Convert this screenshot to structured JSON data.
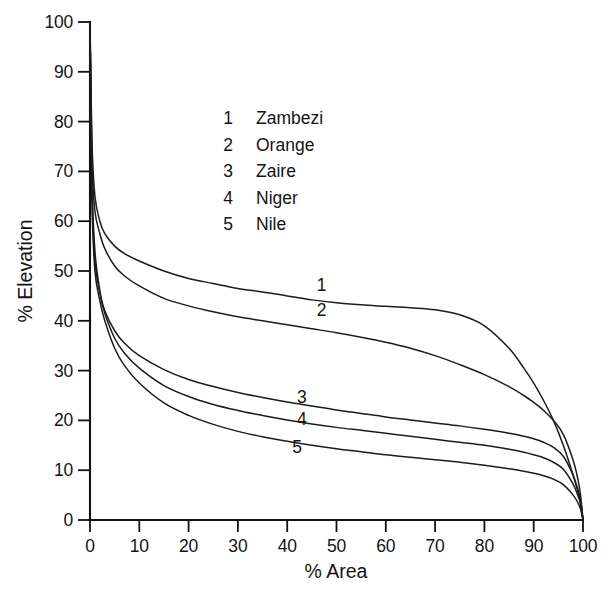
{
  "chart_data": {
    "type": "line",
    "title": "",
    "xlabel": "% Area",
    "ylabel": "% Elevation",
    "xlim": [
      0,
      100
    ],
    "ylim": [
      0,
      100
    ],
    "xticks": [
      0,
      10,
      20,
      30,
      40,
      50,
      60,
      70,
      80,
      90,
      100
    ],
    "yticks": [
      0,
      10,
      20,
      30,
      40,
      50,
      60,
      70,
      80,
      90,
      100
    ],
    "grid": false,
    "legend_position": "upper-center-inside",
    "legend": [
      {
        "key": "1",
        "label": "Zambezi"
      },
      {
        "key": "2",
        "label": "Orange"
      },
      {
        "key": "3",
        "label": "Zaire"
      },
      {
        "key": "4",
        "label": "Niger"
      },
      {
        "key": "5",
        "label": "Nile"
      }
    ],
    "annotations": [
      {
        "text": "1",
        "x": 47,
        "y": 46
      },
      {
        "text": "2",
        "x": 47,
        "y": 41
      },
      {
        "text": "3",
        "x": 43,
        "y": 23.5
      },
      {
        "text": "4",
        "x": 43,
        "y": 19
      },
      {
        "text": "5",
        "x": 42,
        "y": 13.5
      }
    ],
    "x": [
      0,
      0.4,
      1,
      2,
      3,
      5,
      7,
      10,
      15,
      20,
      25,
      30,
      35,
      40,
      45,
      50,
      55,
      60,
      65,
      70,
      75,
      80,
      85,
      88,
      90,
      92,
      94,
      96,
      98,
      99,
      99.5,
      100
    ],
    "series": [
      {
        "name": "Zambezi",
        "key": "1",
        "values": [
          100,
          76,
          65,
          60,
          57.5,
          55,
          53.5,
          52,
          50,
          48.5,
          47.5,
          46.5,
          45.8,
          45,
          44.2,
          43.6,
          43.2,
          42.9,
          42.6,
          42.2,
          41.2,
          39,
          34.5,
          30.5,
          27.5,
          24,
          20,
          15,
          9,
          5.5,
          3.5,
          0
        ]
      },
      {
        "name": "Orange",
        "key": "2",
        "values": [
          100,
          72,
          62,
          57.5,
          54.5,
          51,
          49,
          47,
          44.5,
          43,
          41.8,
          40.8,
          40,
          39.2,
          38.4,
          37.6,
          36.7,
          35.7,
          34.5,
          33,
          31.2,
          29.2,
          26.8,
          25,
          23.6,
          22,
          20,
          17.2,
          12,
          8,
          5,
          0
        ]
      },
      {
        "name": "Zaire",
        "key": "3",
        "values": [
          100,
          68,
          54,
          46,
          42,
          38,
          35.5,
          33,
          30.2,
          28.2,
          26.8,
          25.6,
          24.6,
          23.7,
          22.9,
          22.1,
          21.4,
          20.7,
          20.1,
          19.5,
          18.9,
          18.2,
          17.4,
          16.8,
          16.3,
          15.6,
          14.6,
          12.8,
          9,
          6,
          4,
          0
        ]
      },
      {
        "name": "Niger",
        "key": "4",
        "values": [
          100,
          66,
          52,
          45.5,
          41.5,
          36.5,
          33.5,
          30.5,
          27,
          24.8,
          23.2,
          22,
          21,
          20.1,
          19.3,
          18.6,
          18,
          17.4,
          16.8,
          16.2,
          15.6,
          15,
          14.2,
          13.6,
          13.1,
          12.5,
          11.6,
          10.2,
          7.2,
          4.8,
          3.2,
          0
        ]
      },
      {
        "name": "Nile",
        "key": "5",
        "values": [
          100,
          64,
          50,
          44,
          40,
          34.5,
          31,
          27.5,
          23.5,
          21,
          19.2,
          17.8,
          16.7,
          15.8,
          15,
          14.3,
          13.7,
          13.1,
          12.6,
          12.1,
          11.6,
          11,
          10.3,
          9.8,
          9.4,
          8.9,
          8.2,
          7.1,
          5,
          3.4,
          2.2,
          0
        ]
      }
    ]
  },
  "colors": {
    "axis": "#111111",
    "curve": "#1c1c1c",
    "background": "#ffffff",
    "text": "#141414"
  }
}
